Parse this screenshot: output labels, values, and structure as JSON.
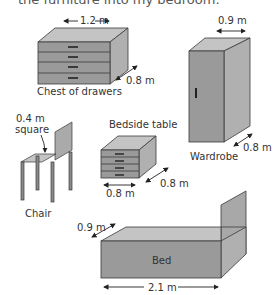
{
  "header": {
    "cut_text": "the furniture into my bedroom."
  },
  "colors": {
    "front": "#9a9a9a",
    "top": "#c4c4c4",
    "side": "#b0b0b0",
    "outline": "#3a3a3a",
    "handle": "#222222",
    "text": "#333333"
  },
  "items": {
    "chest": {
      "name": "Chest of drawers",
      "width": "1.2 m",
      "depth": "0.8 m"
    },
    "wardrobe": {
      "name": "Wardrobe",
      "width": "0.9 m",
      "depth": "0.8 m"
    },
    "chair": {
      "name": "Chair",
      "seat_size": "0.4 m",
      "seat_note": "square"
    },
    "bedside": {
      "name": "Bedside table",
      "width": "0.8 m",
      "depth": "0.8 m"
    },
    "bed": {
      "name": "Bed",
      "width": "0.9 m",
      "length": "2.1 m"
    }
  }
}
